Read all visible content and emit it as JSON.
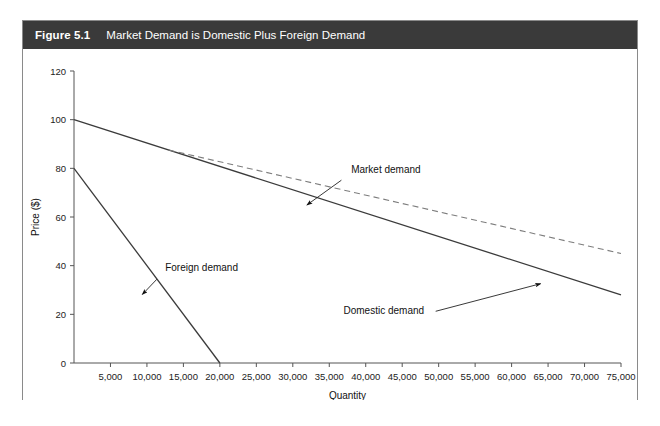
{
  "figure": {
    "label": "Figure 5.1",
    "title": "Market Demand is Domestic Plus Foreign Demand"
  },
  "chart_data": {
    "type": "line",
    "title": "Market Demand is Domestic Plus Foreign Demand",
    "xlabel": "Quantity",
    "ylabel": "Price ($)",
    "xlim": [
      0,
      75000
    ],
    "ylim": [
      0,
      120
    ],
    "grid": false,
    "legend": "annotations",
    "xticks": [
      5000,
      10000,
      15000,
      20000,
      25000,
      30000,
      35000,
      40000,
      45000,
      50000,
      55000,
      60000,
      65000,
      70000,
      75000
    ],
    "xticklabels": [
      "5,000",
      "10,000",
      "15,000",
      "20,000",
      "25,000",
      "30,000",
      "35,000",
      "40,000",
      "45,000",
      "50,000",
      "55,000",
      "60,000",
      "65,000",
      "70,000",
      "75,000"
    ],
    "yticks": [
      0,
      20,
      40,
      60,
      80,
      100,
      120
    ],
    "yticklabels": [
      "0",
      "20",
      "40",
      "60",
      "80",
      "100",
      "120"
    ],
    "series": [
      {
        "name": "Domestic demand",
        "style": "solid",
        "color": "#3b3b3b",
        "points": [
          [
            0,
            100
          ],
          [
            75000,
            28
          ]
        ]
      },
      {
        "name": "Foreign demand",
        "style": "solid",
        "color": "#3b3b3b",
        "points": [
          [
            0,
            80
          ],
          [
            20000,
            0
          ]
        ]
      },
      {
        "name": "Market demand",
        "style": "dashed",
        "color": "#7d7d7d",
        "points": [
          [
            13000,
            87.5
          ],
          [
            75000,
            45
          ]
        ]
      }
    ],
    "annotations": [
      {
        "text": "Market demand",
        "text_xy": [
          38000,
          78
        ],
        "arrow_xy": [
          31500,
          64
        ]
      },
      {
        "text": "Foreign demand",
        "text_xy": [
          12500,
          38
        ],
        "arrow_xy": [
          9000,
          27
        ]
      },
      {
        "text": "Domestic demand",
        "text_xy": [
          48000,
          20
        ],
        "arrow_xy": [
          64500,
          33
        ]
      }
    ]
  },
  "labels": {
    "market_demand": "Market demand",
    "foreign_demand": "Foreign demand",
    "domestic_demand": "Domestic demand"
  }
}
